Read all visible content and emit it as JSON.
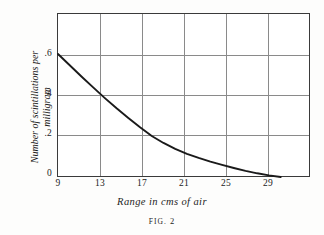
{
  "figure": {
    "caption_prefix": "FIG.",
    "caption_number": "2"
  },
  "chart_data": {
    "type": "line",
    "title": "",
    "xlabel": "Range in cms of air",
    "ylabel": "Number of scintillations per milligram",
    "ylabel_line1": "Number of scintillations per",
    "ylabel_line2": "milligram",
    "xlim": [
      9,
      30.5
    ],
    "ylim": [
      0,
      0.8
    ],
    "xticks": [
      9,
      13,
      17,
      21,
      25,
      29
    ],
    "xtick_labels": [
      "9",
      "13",
      "17",
      "21",
      "25",
      "29"
    ],
    "yticks": [
      0,
      0.2,
      0.4,
      0.6
    ],
    "ytick_labels": [
      "0",
      ".2",
      ".4",
      ".6"
    ],
    "grid": true,
    "grid_color": "#8a8a8a",
    "frame_color": "#3a3a3a",
    "curve_color": "#1a1a1a",
    "legend": null,
    "series": [
      {
        "name": "scintillations per milligram vs range",
        "x": [
          9,
          10,
          11,
          12,
          13,
          14,
          15,
          16,
          17,
          18,
          19,
          20,
          21,
          22,
          23,
          24,
          25,
          26,
          27,
          28
        ],
        "y": [
          0.6,
          0.545,
          0.49,
          0.437,
          0.385,
          0.335,
          0.288,
          0.243,
          0.2,
          0.166,
          0.137,
          0.113,
          0.093,
          0.075,
          0.059,
          0.044,
          0.03,
          0.018,
          0.008,
          0.0
        ]
      }
    ],
    "annotations": []
  }
}
